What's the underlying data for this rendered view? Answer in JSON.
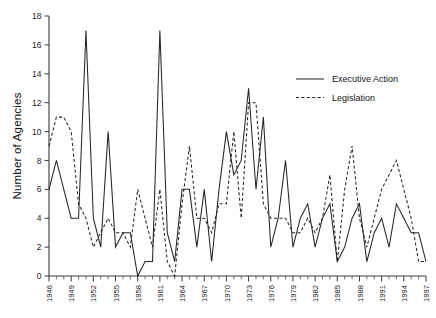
{
  "chart_data": {
    "type": "line",
    "title": "",
    "xlabel": "",
    "ylabel": "Number of Agencies",
    "xlim": [
      1946,
      1997
    ],
    "ylim": [
      0,
      18
    ],
    "ytick_step": 2,
    "xtick_step": 3,
    "grid": false,
    "legend_position": "upper-right",
    "yticks": [
      0,
      2,
      4,
      6,
      8,
      10,
      12,
      14,
      16,
      18
    ],
    "ytick_labels": [
      "0",
      "2",
      "4",
      "6",
      "8",
      "10",
      "12",
      "14",
      "16",
      "18"
    ],
    "xticks": [
      1946,
      1949,
      1952,
      1955,
      1958,
      1961,
      1964,
      1967,
      1970,
      1973,
      1976,
      1979,
      1982,
      1985,
      1988,
      1991,
      1994,
      1997
    ],
    "xtick_labels": [
      "1946",
      "1949",
      "1952",
      "1955",
      "1958",
      "1961",
      "1964",
      "1967",
      "1970",
      "1973",
      "1976",
      "1979",
      "1982",
      "1985",
      "1988",
      "1991",
      "1994",
      "1997"
    ],
    "x": [
      1946,
      1947,
      1948,
      1949,
      1950,
      1951,
      1952,
      1953,
      1954,
      1955,
      1956,
      1957,
      1958,
      1959,
      1960,
      1961,
      1962,
      1963,
      1964,
      1965,
      1966,
      1967,
      1968,
      1969,
      1970,
      1971,
      1972,
      1973,
      1974,
      1975,
      1976,
      1977,
      1978,
      1979,
      1980,
      1981,
      1982,
      1983,
      1984,
      1985,
      1986,
      1987,
      1988,
      1989,
      1990,
      1991,
      1992,
      1993,
      1994,
      1995,
      1996,
      1997
    ],
    "series": [
      {
        "name": "Executive Action",
        "style": "solid",
        "color": "#252525",
        "values": [
          6,
          8,
          6,
          4,
          4,
          17,
          4,
          2,
          10,
          2,
          3,
          3,
          0,
          1,
          1,
          17,
          3,
          1,
          6,
          6,
          2,
          6,
          1,
          6,
          10,
          7,
          8,
          13,
          6,
          11,
          2,
          4,
          8,
          2,
          4,
          5,
          2,
          4,
          5,
          1,
          2,
          4,
          5,
          1,
          3,
          4,
          2,
          5,
          4,
          3,
          3,
          1
        ]
      },
      {
        "name": "Legislation",
        "style": "dashed",
        "color": "#252525",
        "values": [
          9,
          11,
          11,
          10,
          5,
          4,
          2,
          3,
          4,
          3,
          3,
          2,
          6,
          4,
          2,
          6,
          1,
          0,
          5,
          9,
          4,
          4,
          3,
          5,
          5,
          10,
          4,
          12,
          12,
          5,
          4,
          4,
          4,
          3,
          3,
          4,
          3,
          4,
          7,
          1,
          6,
          9,
          4,
          2,
          4,
          6,
          7,
          8,
          6,
          4,
          1,
          1
        ]
      }
    ],
    "legend": [
      {
        "label": "Executive Action",
        "style": "solid"
      },
      {
        "label": "Legislation",
        "style": "dashed"
      }
    ]
  }
}
